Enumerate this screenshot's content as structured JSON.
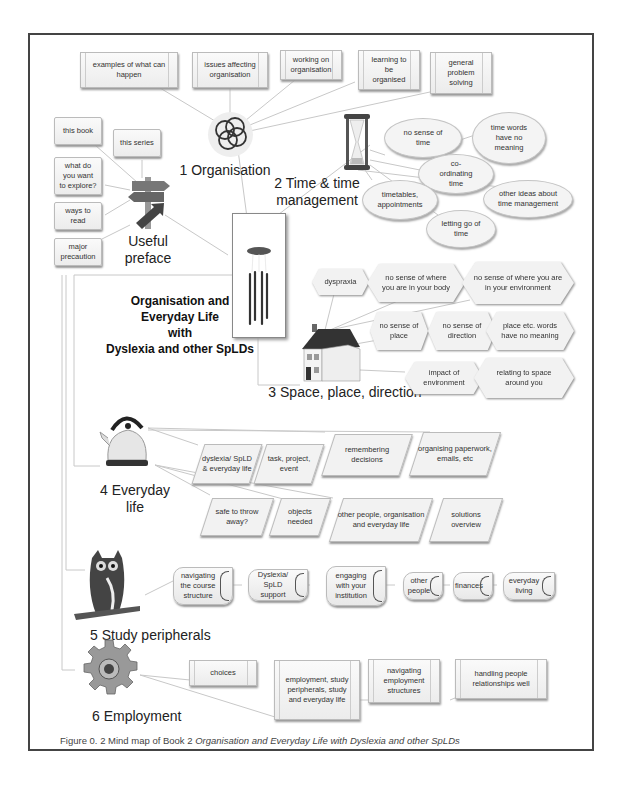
{
  "central": {
    "title_lines": [
      "Organisation and",
      "Everyday Life",
      "with",
      "Dyslexia and other SpLDs"
    ]
  },
  "branches": {
    "preface": {
      "label_lines": [
        "Useful",
        "preface"
      ],
      "items": [
        "this book",
        "this series",
        "what do you want to explore?",
        "ways to read",
        "major precaution"
      ]
    },
    "organisation": {
      "label": "1 Organisation",
      "items": [
        "examples of what can happen",
        "issues affecting organisation",
        "working on organisation",
        "learning to be organised",
        "general problem solving"
      ]
    },
    "time": {
      "label_lines": [
        "2 Time & time",
        "management"
      ],
      "items": [
        "no sense of time",
        "time words have no meaning",
        "co-ordinating time",
        "timetables, appointments",
        "other ideas about time management",
        "letting go of time"
      ]
    },
    "space": {
      "label": "3 Space, place, direction",
      "items": [
        "dyspraxia",
        "no sense of where you are in your body",
        "no sense of where you are in your environment",
        "no sense of place",
        "no sense of direction",
        "place etc. words have no meaning",
        "impact of environment",
        "relating to space around you"
      ]
    },
    "everyday": {
      "label_lines": [
        "4 Everyday",
        "life"
      ],
      "items": [
        "dyslexia/ SpLD & everyday life",
        "task, project, event",
        "remembering decisions",
        "organising paperwork, emails, etc",
        "safe to throw away?",
        "objects needed",
        "other people, organisation and everyday life",
        "solutions overview"
      ]
    },
    "study": {
      "label": "5 Study peripherals",
      "items": [
        "navigating the course structure",
        "Dyslexia/ SpLD support",
        "engaging with your institution",
        "other people",
        "finances",
        "everyday living"
      ]
    },
    "employment": {
      "label": "6 Employment",
      "items": [
        "choices",
        "employment, study peripherals, study and everyday life",
        "navigating employment structures",
        "handling people relationships well"
      ]
    }
  },
  "caption": {
    "prefix": "Figure 0. 2  Mind map of Book 2 ",
    "italic": "Organisation and Everyday Life with Dyslexia and other SpLDs"
  },
  "icons": [
    "wind-chime-icon",
    "rings-icon",
    "signpost-icon",
    "hourglass-icon",
    "house-icon",
    "kettle-icon",
    "owl-icon",
    "gear-icon"
  ]
}
